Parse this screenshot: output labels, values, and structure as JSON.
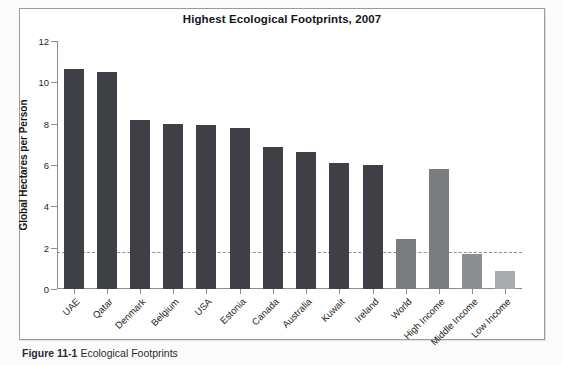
{
  "figure": {
    "caption_label": "Figure 11-1",
    "caption_text": "Ecological Footprints"
  },
  "chart_data": {
    "type": "bar",
    "title": "Highest Ecological Footprints, 2007",
    "xlabel": "",
    "ylabel": "Global Hectares per Person",
    "ylim": [
      0,
      12
    ],
    "yticks": [
      0,
      2,
      4,
      6,
      8,
      10,
      12
    ],
    "ytick_labels": [
      "0",
      "2",
      "4",
      "6",
      "8",
      "10",
      "12"
    ],
    "grid": false,
    "legend": "none",
    "categories": [
      "UAE",
      "Qatar",
      "Denmark",
      "Belgium",
      "USA",
      "Estonia",
      "Canada",
      "Australia",
      "Kuwait",
      "Ireland",
      "World",
      "High Income",
      "Middle Income",
      "Low Income"
    ],
    "values": [
      10.65,
      10.5,
      8.2,
      8.0,
      7.95,
      7.8,
      6.85,
      6.65,
      6.1,
      6.0,
      2.4,
      5.8,
      1.7,
      0.85
    ],
    "bar_colors": [
      "#3f4045",
      "#3f4045",
      "#3f4045",
      "#3f4045",
      "#3f4045",
      "#3f4045",
      "#3f4045",
      "#3f4045",
      "#3f4045",
      "#3f4045",
      "#7b7c80",
      "#7b7c80",
      "#8d8e92",
      "#aaabad"
    ],
    "annotations": [
      {
        "name": "world-biocapacity-threshold",
        "type": "hline",
        "value": 1.8,
        "style": "dashed",
        "color": "#8b8f99"
      }
    ]
  }
}
